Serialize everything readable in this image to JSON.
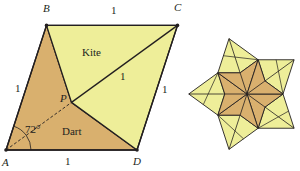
{
  "figure": {
    "colors": {
      "kite": "#eeee99",
      "dart": "#d9b06e",
      "stroke": "#231f20",
      "background": "#ffffff"
    },
    "left_figure": {
      "title": "Rhombus split into a kite and a dart",
      "vertices": {
        "A": {
          "label": "A",
          "x": 6,
          "y": 150
        },
        "B": {
          "label": "B",
          "x": 46.5,
          "y": 25.4
        },
        "C": {
          "label": "C",
          "x": 177.5,
          "y": 25.4
        },
        "D": {
          "label": "D",
          "x": 137,
          "y": 150
        },
        "P": {
          "label": "P",
          "x": 71.5,
          "y": 102.4
        }
      },
      "labels": {
        "A": "A",
        "B": "B",
        "C": "C",
        "D": "D",
        "P": "P",
        "kite": "Kite",
        "dart": "Dart",
        "angle": "72°",
        "side_top": "1",
        "side_left": "1",
        "side_right": "1",
        "side_bottom": "1",
        "diagonal": "1"
      }
    },
    "right_figure": {
      "title": "Five-fold star of darts surrounded by kites",
      "center": {
        "x": 247,
        "y": 94
      },
      "unit": 36,
      "symmetry": 5
    }
  }
}
